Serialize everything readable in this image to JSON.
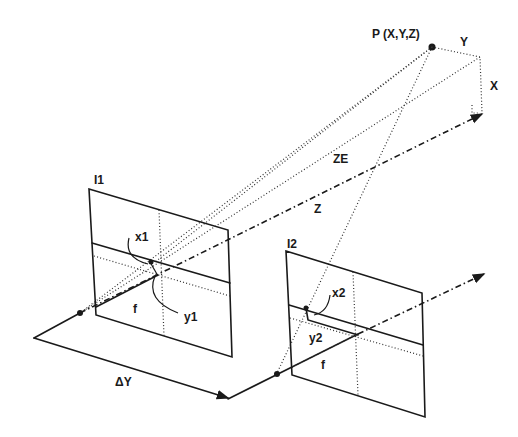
{
  "diagram": {
    "type": "stereo-camera-geometry",
    "labels": {
      "point": "P (X,Y,Z)",
      "y_axis": "Y",
      "x_axis": "X",
      "ze": "ZE",
      "z": "Z",
      "image1": "I1",
      "image2": "I2",
      "x1": "x1",
      "y1": "y1",
      "x2": "x2",
      "y2": "y2",
      "f1": "f",
      "f2": "f",
      "baseline": "ΔY"
    },
    "colors": {
      "line": "#1a1a1a",
      "background": "#ffffff"
    }
  }
}
